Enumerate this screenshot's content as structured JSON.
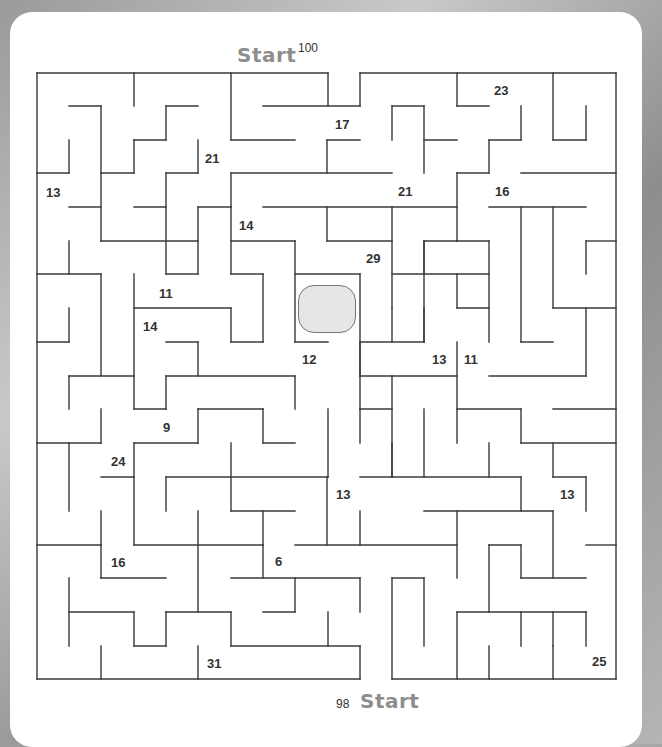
{
  "puzzle": {
    "type": "maze",
    "start_top": {
      "label": "Start",
      "value": "100"
    },
    "start_bottom": {
      "label": "Start",
      "value": "98"
    },
    "center_goal": "goal-box",
    "numbers": [
      {
        "value": "23",
        "x": 494,
        "y": 83
      },
      {
        "value": "17",
        "x": 335,
        "y": 117
      },
      {
        "value": "21",
        "x": 205,
        "y": 151
      },
      {
        "value": "13",
        "x": 46,
        "y": 185
      },
      {
        "value": "21",
        "x": 398,
        "y": 184
      },
      {
        "value": "16",
        "x": 495,
        "y": 184
      },
      {
        "value": "14",
        "x": 239,
        "y": 218
      },
      {
        "value": "29",
        "x": 366,
        "y": 251
      },
      {
        "value": "11",
        "x": 159,
        "y": 286
      },
      {
        "value": "14",
        "x": 143,
        "y": 319
      },
      {
        "value": "12",
        "x": 302,
        "y": 352
      },
      {
        "value": "13",
        "x": 432,
        "y": 352
      },
      {
        "value": "11",
        "x": 464,
        "y": 352
      },
      {
        "value": "9",
        "x": 163,
        "y": 420
      },
      {
        "value": "24",
        "x": 111,
        "y": 454
      },
      {
        "value": "13",
        "x": 336,
        "y": 487
      },
      {
        "value": "13",
        "x": 560,
        "y": 487
      },
      {
        "value": "16",
        "x": 111,
        "y": 555
      },
      {
        "value": "6",
        "x": 275,
        "y": 554
      },
      {
        "value": "31",
        "x": 207,
        "y": 656
      },
      {
        "value": "25",
        "x": 592,
        "y": 654
      }
    ],
    "walls": [
      [
        37,
        73,
        328,
        73
      ],
      [
        360,
        73,
        616,
        73
      ],
      [
        37,
        73,
        37,
        679
      ],
      [
        616,
        73,
        616,
        679
      ],
      [
        37,
        679,
        360,
        679
      ],
      [
        392,
        679,
        616,
        679
      ],
      [
        134,
        73,
        134,
        106
      ],
      [
        231,
        73,
        231,
        140
      ],
      [
        328,
        73,
        328,
        106
      ],
      [
        360,
        73,
        360,
        106
      ],
      [
        457,
        73,
        457,
        106
      ],
      [
        553,
        73,
        553,
        140
      ],
      [
        69,
        106,
        101,
        106
      ],
      [
        101,
        106,
        101,
        173
      ],
      [
        166,
        106,
        198,
        106
      ],
      [
        166,
        106,
        166,
        140
      ],
      [
        263,
        106,
        360,
        106
      ],
      [
        392,
        106,
        424,
        106
      ],
      [
        392,
        106,
        392,
        140
      ],
      [
        424,
        106,
        424,
        173
      ],
      [
        457,
        106,
        489,
        106
      ],
      [
        521,
        106,
        521,
        140
      ],
      [
        586,
        106,
        586,
        140
      ],
      [
        134,
        140,
        166,
        140
      ],
      [
        134,
        140,
        134,
        173
      ],
      [
        231,
        140,
        295,
        140
      ],
      [
        327,
        140,
        360,
        140
      ],
      [
        327,
        140,
        327,
        173
      ],
      [
        424,
        140,
        457,
        140
      ],
      [
        489,
        140,
        521,
        140
      ],
      [
        489,
        140,
        489,
        173
      ],
      [
        553,
        140,
        586,
        140
      ],
      [
        69,
        140,
        69,
        173
      ],
      [
        37,
        173,
        69,
        173
      ],
      [
        101,
        173,
        134,
        173
      ],
      [
        166,
        173,
        198,
        173
      ],
      [
        198,
        140,
        198,
        173
      ],
      [
        231,
        173,
        392,
        173
      ],
      [
        231,
        173,
        231,
        207
      ],
      [
        457,
        173,
        489,
        173
      ],
      [
        457,
        173,
        457,
        241
      ],
      [
        521,
        173,
        616,
        173
      ],
      [
        69,
        207,
        101,
        207
      ],
      [
        101,
        173,
        101,
        241
      ],
      [
        134,
        207,
        166,
        207
      ],
      [
        166,
        173,
        166,
        274
      ],
      [
        198,
        207,
        231,
        207
      ],
      [
        263,
        207,
        457,
        207
      ],
      [
        392,
        207,
        392,
        308
      ],
      [
        489,
        207,
        586,
        207
      ],
      [
        553,
        207,
        553,
        308
      ],
      [
        69,
        241,
        69,
        274
      ],
      [
        101,
        241,
        198,
        241
      ],
      [
        231,
        207,
        231,
        274
      ],
      [
        231,
        241,
        295,
        241
      ],
      [
        295,
        241,
        295,
        342
      ],
      [
        327,
        207,
        327,
        241
      ],
      [
        327,
        241,
        392,
        241
      ],
      [
        424,
        241,
        457,
        241
      ],
      [
        424,
        241,
        424,
        342
      ],
      [
        457,
        241,
        489,
        241
      ],
      [
        489,
        241,
        489,
        342
      ],
      [
        586,
        241,
        616,
        241
      ],
      [
        586,
        241,
        586,
        274
      ],
      [
        37,
        274,
        101,
        274
      ],
      [
        101,
        274,
        101,
        376
      ],
      [
        134,
        274,
        134,
        409
      ],
      [
        166,
        274,
        198,
        274
      ],
      [
        198,
        207,
        198,
        274
      ],
      [
        231,
        274,
        263,
        274
      ],
      [
        263,
        274,
        263,
        342
      ],
      [
        295,
        274,
        360,
        274
      ],
      [
        360,
        274,
        360,
        376
      ],
      [
        392,
        274,
        489,
        274
      ],
      [
        424,
        241,
        424,
        274
      ],
      [
        457,
        274,
        457,
        308
      ],
      [
        521,
        207,
        521,
        342
      ],
      [
        553,
        308,
        616,
        308
      ],
      [
        69,
        308,
        69,
        342
      ],
      [
        37,
        342,
        69,
        342
      ],
      [
        134,
        308,
        231,
        308
      ],
      [
        231,
        308,
        231,
        342
      ],
      [
        231,
        342,
        263,
        342
      ],
      [
        295,
        342,
        328,
        342
      ],
      [
        392,
        308,
        392,
        342
      ],
      [
        360,
        342,
        424,
        342
      ],
      [
        424,
        308,
        424,
        342
      ],
      [
        457,
        308,
        489,
        308
      ],
      [
        521,
        342,
        553,
        342
      ],
      [
        586,
        308,
        586,
        376
      ],
      [
        166,
        342,
        198,
        342
      ],
      [
        198,
        342,
        198,
        376
      ],
      [
        360,
        342,
        360,
        409
      ],
      [
        360,
        376,
        392,
        376
      ],
      [
        69,
        376,
        134,
        376
      ],
      [
        69,
        376,
        69,
        409
      ],
      [
        166,
        376,
        295,
        376
      ],
      [
        166,
        376,
        166,
        409
      ],
      [
        295,
        376,
        295,
        409
      ],
      [
        392,
        376,
        457,
        376
      ],
      [
        457,
        342,
        457,
        443
      ],
      [
        489,
        376,
        586,
        376
      ],
      [
        134,
        409,
        166,
        409
      ],
      [
        198,
        409,
        263,
        409
      ],
      [
        198,
        409,
        198,
        443
      ],
      [
        263,
        409,
        263,
        443
      ],
      [
        263,
        443,
        295,
        443
      ],
      [
        328,
        409,
        328,
        477
      ],
      [
        360,
        409,
        392,
        409
      ],
      [
        360,
        409,
        360,
        443
      ],
      [
        392,
        376,
        392,
        477
      ],
      [
        424,
        409,
        424,
        477
      ],
      [
        457,
        409,
        521,
        409
      ],
      [
        521,
        409,
        521,
        443
      ],
      [
        521,
        443,
        616,
        443
      ],
      [
        553,
        409,
        616,
        409
      ],
      [
        37,
        443,
        101,
        443
      ],
      [
        101,
        409,
        101,
        443
      ],
      [
        134,
        443,
        198,
        443
      ],
      [
        134,
        443,
        134,
        545
      ],
      [
        231,
        443,
        231,
        511
      ],
      [
        392,
        443,
        392,
        477
      ],
      [
        489,
        443,
        489,
        477
      ],
      [
        553,
        443,
        553,
        477
      ],
      [
        69,
        443,
        69,
        511
      ],
      [
        101,
        477,
        134,
        477
      ],
      [
        166,
        477,
        328,
        477
      ],
      [
        166,
        477,
        166,
        511
      ],
      [
        231,
        511,
        295,
        511
      ],
      [
        327,
        477,
        327,
        545
      ],
      [
        360,
        477,
        521,
        477
      ],
      [
        521,
        477,
        521,
        511
      ],
      [
        553,
        477,
        586,
        477
      ],
      [
        586,
        477,
        586,
        511
      ],
      [
        101,
        511,
        101,
        545
      ],
      [
        37,
        545,
        101,
        545
      ],
      [
        198,
        511,
        198,
        612
      ],
      [
        263,
        511,
        263,
        545
      ],
      [
        424,
        511,
        553,
        511
      ],
      [
        360,
        511,
        360,
        545
      ],
      [
        457,
        511,
        457,
        578
      ],
      [
        553,
        511,
        553,
        578
      ],
      [
        586,
        545,
        616,
        545
      ],
      [
        134,
        545,
        263,
        545
      ],
      [
        263,
        545,
        263,
        578
      ],
      [
        295,
        545,
        457,
        545
      ],
      [
        489,
        545,
        521,
        545
      ],
      [
        489,
        545,
        489,
        612
      ],
      [
        101,
        545,
        101,
        578
      ],
      [
        101,
        578,
        166,
        578
      ],
      [
        231,
        578,
        360,
        578
      ],
      [
        295,
        578,
        295,
        612
      ],
      [
        263,
        612,
        295,
        612
      ],
      [
        360,
        578,
        360,
        612
      ],
      [
        392,
        578,
        424,
        578
      ],
      [
        424,
        578,
        424,
        646
      ],
      [
        521,
        578,
        586,
        578
      ],
      [
        521,
        545,
        521,
        578
      ],
      [
        69,
        578,
        69,
        646
      ],
      [
        69,
        612,
        134,
        612
      ],
      [
        134,
        612,
        134,
        646
      ],
      [
        134,
        646,
        166,
        646
      ],
      [
        166,
        612,
        166,
        646
      ],
      [
        166,
        612,
        231,
        612
      ],
      [
        231,
        612,
        231,
        646
      ],
      [
        231,
        646,
        360,
        646
      ],
      [
        328,
        612,
        328,
        646
      ],
      [
        392,
        578,
        392,
        679
      ],
      [
        457,
        612,
        586,
        612
      ],
      [
        457,
        612,
        457,
        679
      ],
      [
        521,
        612,
        521,
        646
      ],
      [
        586,
        612,
        586,
        646
      ],
      [
        553,
        612,
        553,
        646
      ],
      [
        101,
        646,
        101,
        679
      ],
      [
        198,
        646,
        198,
        679
      ],
      [
        360,
        646,
        360,
        679
      ],
      [
        489,
        646,
        489,
        679
      ],
      [
        553,
        646,
        553,
        679
      ]
    ]
  }
}
